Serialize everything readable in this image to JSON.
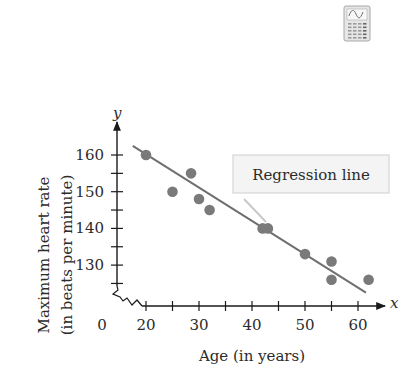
{
  "chart_data": {
    "type": "scatter",
    "title": "",
    "xlabel": "Age (in years)",
    "ylabel_line1": "Maximum heart rate",
    "ylabel_line2": "(in beats per minute)",
    "x_axis_var": "x",
    "y_axis_var": "y",
    "x_ticks": [
      20,
      25,
      30,
      35,
      40,
      45,
      50,
      55,
      60
    ],
    "x_tick_labels": [
      "0",
      "20",
      "30",
      "40",
      "50",
      "60"
    ],
    "y_ticks": [
      125,
      130,
      135,
      140,
      145,
      150,
      155,
      160
    ],
    "y_tick_labels": [
      "130",
      "140",
      "150",
      "160"
    ],
    "xlim": [
      18,
      64
    ],
    "ylim": [
      122,
      162
    ],
    "axis_break": true,
    "grid": false,
    "points": [
      {
        "x": 20,
        "y": 160
      },
      {
        "x": 25,
        "y": 150
      },
      {
        "x": 28.5,
        "y": 155
      },
      {
        "x": 30,
        "y": 148
      },
      {
        "x": 32,
        "y": 145
      },
      {
        "x": 42,
        "y": 140
      },
      {
        "x": 43,
        "y": 140
      },
      {
        "x": 50,
        "y": 133
      },
      {
        "x": 55,
        "y": 131
      },
      {
        "x": 55,
        "y": 126
      },
      {
        "x": 62,
        "y": 126
      }
    ],
    "regression_line": {
      "label": "Regression line",
      "x_start": 17.5,
      "y_start": 162.5,
      "x_end": 61.5,
      "y_end": 122.5
    },
    "colors": {
      "points": "#7a7a7a",
      "line": "#6f6f6f",
      "axes": "#1a1a1a",
      "callout_bg": "#f4f4f4",
      "callout_border": "#d6d6d6",
      "leader": "#c8c8c8"
    }
  },
  "icon": {
    "name": "graphing-calculator-icon"
  }
}
